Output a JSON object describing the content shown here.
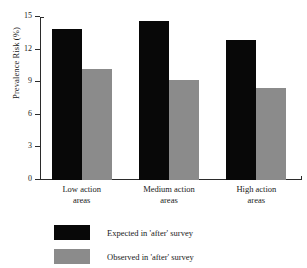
{
  "chart_data": {
    "type": "bar",
    "title": "",
    "xlabel": "",
    "ylabel": "Prevalence Risk (%)",
    "categories": [
      "Low action areas",
      "Medium action areas",
      "High action areas"
    ],
    "category_lines": [
      [
        "Low action",
        "areas"
      ],
      [
        "Medium action",
        "areas"
      ],
      [
        "High action",
        "areas"
      ]
    ],
    "series": [
      {
        "name": "Expected in 'after' survey",
        "color": "#080808",
        "values": [
          13.9,
          14.6,
          12.9
        ]
      },
      {
        "name": "Observed in 'after' survey",
        "color": "#8b8b8b",
        "values": [
          10.2,
          9.2,
          8.5
        ]
      }
    ],
    "ylim": [
      0,
      15
    ],
    "yticks": [
      0,
      3,
      6,
      9,
      12,
      15
    ],
    "ytick_labels": [
      "0",
      "3",
      "6",
      "9",
      "12",
      "15"
    ],
    "grid": false,
    "legend_position": "bottom-left"
  },
  "legend": {
    "items": [
      {
        "label": "Expected in 'after' survey",
        "swatch": "black"
      },
      {
        "label": "Observed in 'after' survey",
        "swatch": "gray"
      }
    ]
  }
}
